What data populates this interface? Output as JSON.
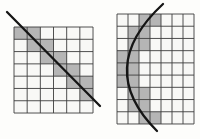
{
  "figure": {
    "canvas": {
      "width": 200,
      "height": 139
    },
    "colors": {
      "background": "#fdfdfb",
      "shaded_cell": "#b5b5b5",
      "empty_cell": "#f8f8f6",
      "grid_line": "#3c3c3c",
      "stroke": "#151515"
    },
    "grids": [
      {
        "name": "diagonal-line-grid",
        "x": 14,
        "y": 27,
        "cols": 6,
        "rows": 7,
        "cell_w": 13.17,
        "cell_h": 12.29,
        "shaded_cells": [
          [
            0,
            0
          ],
          [
            1,
            0
          ],
          [
            1,
            1
          ],
          [
            2,
            1
          ],
          [
            2,
            2
          ],
          [
            3,
            2
          ],
          [
            3,
            3
          ],
          [
            4,
            3
          ],
          [
            4,
            4
          ],
          [
            5,
            4
          ],
          [
            5,
            5
          ]
        ],
        "overlay": {
          "kind": "line",
          "x1": 7,
          "y1": 12,
          "x2": 100,
          "y2": 106,
          "width": 2.3
        }
      },
      {
        "name": "curve-grid",
        "x": 117,
        "y": 14,
        "cols": 7,
        "rows": 9,
        "cell_w": 11,
        "cell_h": 12.22,
        "shaded_cells": [
          [
            2,
            0
          ],
          [
            3,
            0
          ],
          [
            1,
            1
          ],
          [
            2,
            1
          ],
          [
            1,
            2
          ],
          [
            2,
            2
          ],
          [
            0,
            3
          ],
          [
            1,
            3
          ],
          [
            0,
            4
          ],
          [
            1,
            4
          ],
          [
            0,
            5
          ],
          [
            1,
            5
          ],
          [
            1,
            6
          ],
          [
            2,
            6
          ],
          [
            1,
            7
          ],
          [
            2,
            7
          ],
          [
            2,
            8
          ],
          [
            3,
            8
          ]
        ],
        "overlay": {
          "kind": "curve",
          "path": "M 163 4 Q 94 68 157 131",
          "width": 2.3
        }
      }
    ]
  }
}
